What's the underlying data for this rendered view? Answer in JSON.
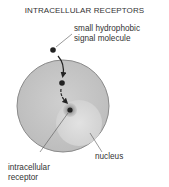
{
  "title": "INTRACELLULAR RECEPTORS",
  "labels": {
    "molecule_line1": "small hydrophobic",
    "molecule_line2": "signal molecule",
    "nucleus": "nucleus",
    "receptor_line1": "intracellular",
    "receptor_line2": "receptor"
  },
  "colors": {
    "cell_fill": "#c4c4c4",
    "cell_stroke": "#8a8a8a",
    "nucleus_fill": "#dadada",
    "molecule": "#222222",
    "receptor_halo": "#999999"
  }
}
